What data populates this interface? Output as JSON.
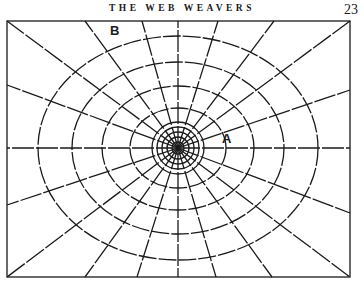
{
  "page": {
    "running_head": "THE WEB WEAVERS",
    "page_number": "23"
  },
  "figure": {
    "labels": {
      "a": "A",
      "b": "B"
    },
    "colors": {
      "ink": "#1a1a1a",
      "paper": "#ffffff"
    }
  }
}
